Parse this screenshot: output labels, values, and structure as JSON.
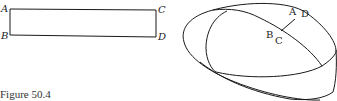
{
  "figure": {
    "caption": "Figure 50.4",
    "rectangle": {
      "labels": {
        "top_left": "A",
        "bottom_left": "B",
        "top_right": "C",
        "bottom_right": "D"
      }
    },
    "mobius_strip": {
      "labels": {
        "a": "A",
        "d": "D",
        "b": "B",
        "c": "C"
      }
    },
    "colors": {
      "line": "#1a1a1a",
      "background": "#ffffff"
    }
  }
}
